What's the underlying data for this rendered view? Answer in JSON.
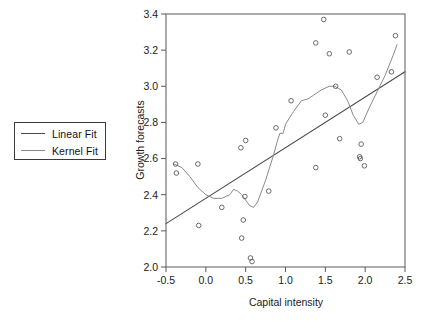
{
  "legend": {
    "position": "left-outside",
    "items": [
      {
        "label": "Linear Fit",
        "color": "#4a4a4a",
        "width": 1.1
      },
      {
        "label": "Kernel Fit",
        "color": "#8a8a8a",
        "width": 1.0
      }
    ]
  },
  "chart_data": {
    "type": "scatter",
    "title": "",
    "xlabel": "Capital intensity",
    "ylabel": "Growth forecasts",
    "xlim": [
      -0.5,
      2.5
    ],
    "ylim": [
      2.0,
      3.4
    ],
    "xticks": [
      "-0.5",
      "0.0",
      "0.5",
      "1.0",
      "1.5",
      "2.0",
      "2.5"
    ],
    "xtick_values": [
      -0.5,
      0.0,
      0.5,
      1.0,
      1.5,
      2.0,
      2.5
    ],
    "yticks": [
      "2.0",
      "2.2",
      "2.4",
      "2.6",
      "2.8",
      "3.0",
      "3.2",
      "3.4"
    ],
    "ytick_values": [
      2.0,
      2.2,
      2.4,
      2.6,
      2.8,
      3.0,
      3.2,
      3.4
    ],
    "grid": false,
    "frame": true,
    "marker": "open-circle",
    "marker_color": "#5a5a5a",
    "points": [
      {
        "x": -0.38,
        "y": 2.57
      },
      {
        "x": -0.37,
        "y": 2.52
      },
      {
        "x": -0.1,
        "y": 2.57
      },
      {
        "x": -0.09,
        "y": 2.23
      },
      {
        "x": 0.2,
        "y": 2.33
      },
      {
        "x": 0.44,
        "y": 2.66
      },
      {
        "x": 0.5,
        "y": 2.7
      },
      {
        "x": 0.49,
        "y": 2.39
      },
      {
        "x": 0.47,
        "y": 2.26
      },
      {
        "x": 0.45,
        "y": 2.16
      },
      {
        "x": 0.56,
        "y": 2.05
      },
      {
        "x": 0.58,
        "y": 2.03
      },
      {
        "x": 0.79,
        "y": 2.42
      },
      {
        "x": 0.88,
        "y": 2.77
      },
      {
        "x": 1.07,
        "y": 2.92
      },
      {
        "x": 1.38,
        "y": 2.55
      },
      {
        "x": 1.38,
        "y": 3.24
      },
      {
        "x": 1.48,
        "y": 3.37
      },
      {
        "x": 1.5,
        "y": 2.84
      },
      {
        "x": 1.55,
        "y": 3.18
      },
      {
        "x": 1.63,
        "y": 3.0
      },
      {
        "x": 1.68,
        "y": 2.71
      },
      {
        "x": 1.8,
        "y": 3.19
      },
      {
        "x": 1.93,
        "y": 2.61
      },
      {
        "x": 1.94,
        "y": 2.6
      },
      {
        "x": 1.95,
        "y": 2.68
      },
      {
        "x": 1.99,
        "y": 2.56
      },
      {
        "x": 2.15,
        "y": 3.05
      },
      {
        "x": 2.33,
        "y": 3.08
      },
      {
        "x": 2.38,
        "y": 3.28
      }
    ],
    "series": [
      {
        "name": "Linear Fit",
        "type": "line",
        "color": "#4a4a4a",
        "x": [
          -0.5,
          2.5
        ],
        "values": [
          2.24,
          3.08
        ]
      },
      {
        "name": "Kernel Fit",
        "type": "line",
        "color": "#8a8a8a",
        "x": [
          -0.4,
          -0.3,
          -0.2,
          -0.1,
          0.0,
          0.1,
          0.2,
          0.3,
          0.35,
          0.4,
          0.45,
          0.5,
          0.55,
          0.6,
          0.65,
          0.75,
          0.85,
          0.9,
          0.93,
          0.97,
          1.0,
          1.1,
          1.2,
          1.28,
          1.35,
          1.45,
          1.55,
          1.62,
          1.7,
          1.78,
          1.85,
          1.92,
          1.97,
          2.05,
          2.15,
          2.25,
          2.35,
          2.4
        ],
        "values": [
          2.57,
          2.55,
          2.5,
          2.44,
          2.4,
          2.38,
          2.38,
          2.4,
          2.43,
          2.42,
          2.4,
          2.37,
          2.34,
          2.33,
          2.36,
          2.48,
          2.62,
          2.7,
          2.74,
          2.74,
          2.79,
          2.86,
          2.92,
          2.93,
          2.95,
          2.98,
          3.0,
          3.0,
          2.98,
          2.92,
          2.84,
          2.79,
          2.8,
          2.88,
          2.97,
          3.06,
          3.17,
          3.23
        ]
      }
    ]
  }
}
